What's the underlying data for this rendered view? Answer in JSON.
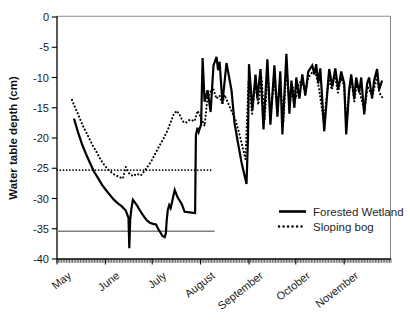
{
  "frame": {
    "background": "#ffffff",
    "plot_border_color": "#8c8c8c",
    "axis_color": "#000000",
    "text_color": "#1a1a1a",
    "tick_label_font_px": 11,
    "legend_font_px": 11.5
  },
  "chart_data": {
    "type": "line",
    "title": "",
    "ylabel": "Water table depth (cm)",
    "xlabel": "",
    "y_axis": {
      "label": "Water table depth (cm)",
      "min": -40,
      "max": 0,
      "tick_step": 5,
      "ticks": [
        0,
        -5,
        -10,
        -15,
        -20,
        -25,
        -30,
        -35,
        -40
      ]
    },
    "x_axis": {
      "unit": "days since May 1",
      "total_days": 214,
      "minor_ticks": "daily",
      "months": [
        {
          "label": "May",
          "start_day": 0
        },
        {
          "label": "June",
          "start_day": 31
        },
        {
          "label": "July",
          "start_day": 61
        },
        {
          "label": "August",
          "start_day": 92
        },
        {
          "label": "September",
          "start_day": 123
        },
        {
          "label": "October",
          "start_day": 153
        },
        {
          "label": "November",
          "start_day": 184
        }
      ]
    },
    "legend": {
      "position": "inside-lower-right",
      "entries": [
        "Forested Wetland",
        "Sloping bog"
      ]
    },
    "reference_lines": [
      {
        "for": "Forested Wetland",
        "style": "solid",
        "color": "#7f7f7f",
        "value": -35.4,
        "from_day": 0,
        "to_day": 101
      },
      {
        "for": "Sloping bog",
        "style": "dotted",
        "color": "#000000",
        "value": -25.3,
        "from_day": 0,
        "to_day": 99
      }
    ],
    "series": [
      {
        "name": "Forested Wetland",
        "style": "solid",
        "color": "#000000",
        "points": [
          [
            10.9,
            -16.8
          ],
          [
            13.4,
            -19.0
          ],
          [
            16.0,
            -21.0
          ],
          [
            18.5,
            -22.6
          ],
          [
            21.1,
            -24.1
          ],
          [
            23.6,
            -25.5
          ],
          [
            26.2,
            -26.6
          ],
          [
            28.8,
            -27.7
          ],
          [
            31.3,
            -28.6
          ],
          [
            33.9,
            -29.4
          ],
          [
            36.4,
            -30.2
          ],
          [
            39.0,
            -30.8
          ],
          [
            41.5,
            -31.3
          ],
          [
            44.1,
            -32.0
          ],
          [
            45.8,
            -33.2
          ],
          [
            46.3,
            -38.2
          ],
          [
            46.9,
            -33.5
          ],
          [
            47.6,
            -31.8
          ],
          [
            48.6,
            -30.2
          ],
          [
            51.1,
            -31.1
          ],
          [
            53.0,
            -31.9
          ],
          [
            55.0,
            -32.7
          ],
          [
            57.5,
            -33.6
          ],
          [
            59.5,
            -34.0
          ],
          [
            61.5,
            -34.2
          ],
          [
            63.5,
            -34.3
          ],
          [
            64.5,
            -34.9
          ],
          [
            66.0,
            -35.5
          ],
          [
            67.5,
            -36.2
          ],
          [
            69.0,
            -36.4
          ],
          [
            69.8,
            -35.7
          ],
          [
            70.3,
            -33.6
          ],
          [
            71.0,
            -31.9
          ],
          [
            71.9,
            -31.1
          ],
          [
            72.8,
            -31.6
          ],
          [
            73.6,
            -30.7
          ],
          [
            75.4,
            -28.6
          ],
          [
            77.3,
            -29.8
          ],
          [
            79.9,
            -30.9
          ],
          [
            81.8,
            -32.2
          ],
          [
            85.0,
            -32.3
          ],
          [
            88.5,
            -32.4
          ],
          [
            89.0,
            -19.5
          ],
          [
            90.0,
            -18.3
          ],
          [
            90.8,
            -19.0
          ],
          [
            91.5,
            -18.4
          ],
          [
            92.3,
            -17.8
          ],
          [
            93.3,
            -6.8
          ],
          [
            94.6,
            -14.0
          ],
          [
            96.5,
            -12.1
          ],
          [
            98.4,
            -15.7
          ],
          [
            100.3,
            -8.0
          ],
          [
            102.2,
            -6.6
          ],
          [
            103.2,
            -8.8
          ],
          [
            104.2,
            -7.4
          ],
          [
            106.0,
            -14.2
          ],
          [
            108.6,
            -7.6
          ],
          [
            111.8,
            -12.1
          ],
          [
            113.7,
            -17.5
          ],
          [
            115.6,
            -20.3
          ],
          [
            118.2,
            -24.0
          ],
          [
            121.4,
            -27.6
          ],
          [
            122.4,
            -20.0
          ],
          [
            123.0,
            -7.8
          ],
          [
            125.2,
            -15.3
          ],
          [
            127.2,
            -9.5
          ],
          [
            128.4,
            -13.5
          ],
          [
            130.4,
            -8.6
          ],
          [
            132.3,
            -18.6
          ],
          [
            134.8,
            -7.0
          ],
          [
            136.7,
            -17.8
          ],
          [
            139.3,
            -8.0
          ],
          [
            141.2,
            -16.5
          ],
          [
            143.1,
            -9.0
          ],
          [
            144.4,
            -19.4
          ],
          [
            147.0,
            -6.1
          ],
          [
            148.9,
            -16.0
          ],
          [
            150.2,
            -10.5
          ],
          [
            152.1,
            -15.0
          ],
          [
            153.3,
            -10.0
          ],
          [
            155.3,
            -13.5
          ],
          [
            157.2,
            -9.5
          ],
          [
            159.1,
            -13.0
          ],
          [
            161.0,
            -9.0
          ],
          [
            163.6,
            -8.0
          ],
          [
            164.9,
            -9.5
          ],
          [
            166.1,
            -7.8
          ],
          [
            167.4,
            -11.0
          ],
          [
            168.7,
            -8.5
          ],
          [
            171.2,
            -18.9
          ],
          [
            174.4,
            -8.6
          ],
          [
            176.4,
            -11.5
          ],
          [
            178.3,
            -8.5
          ],
          [
            180.2,
            -12.0
          ],
          [
            182.1,
            -9.0
          ],
          [
            184.0,
            -11.0
          ],
          [
            185.3,
            -19.4
          ],
          [
            187.2,
            -12.0
          ],
          [
            188.5,
            -9.5
          ],
          [
            190.4,
            -13.5
          ],
          [
            191.7,
            -10.0
          ],
          [
            193.6,
            -12.5
          ],
          [
            194.9,
            -10.0
          ],
          [
            196.8,
            -16.1
          ],
          [
            198.7,
            -11.0
          ],
          [
            200.0,
            -10.0
          ],
          [
            201.9,
            -13.5
          ],
          [
            203.2,
            -10.5
          ],
          [
            205.1,
            -8.6
          ],
          [
            206.4,
            -12.0
          ],
          [
            208.3,
            -10.5
          ]
        ]
      },
      {
        "name": "Sloping bog",
        "style": "dotted",
        "color": "#000000",
        "points": [
          [
            9.6,
            -13.7
          ],
          [
            11.5,
            -14.9
          ],
          [
            13.4,
            -16.0
          ],
          [
            15.3,
            -17.2
          ],
          [
            17.2,
            -18.3
          ],
          [
            19.2,
            -19.3
          ],
          [
            21.1,
            -20.3
          ],
          [
            23.0,
            -21.3
          ],
          [
            24.9,
            -22.1
          ],
          [
            26.8,
            -23.0
          ],
          [
            28.8,
            -23.9
          ],
          [
            30.7,
            -24.6
          ],
          [
            33.9,
            -25.5
          ],
          [
            37.1,
            -26.1
          ],
          [
            40.3,
            -26.5
          ],
          [
            42.2,
            -26.7
          ],
          [
            44.1,
            -24.8
          ],
          [
            46.0,
            -25.8
          ],
          [
            48.6,
            -26.3
          ],
          [
            51.1,
            -25.9
          ],
          [
            53.7,
            -26.2
          ],
          [
            56.2,
            -25.4
          ],
          [
            58.1,
            -24.7
          ],
          [
            60.7,
            -23.7
          ],
          [
            63.3,
            -22.4
          ],
          [
            65.8,
            -21.2
          ],
          [
            68.4,
            -20.0
          ],
          [
            70.9,
            -18.7
          ],
          [
            72.8,
            -17.4
          ],
          [
            74.8,
            -16.1
          ],
          [
            76.7,
            -15.5
          ],
          [
            78.6,
            -16.2
          ],
          [
            80.5,
            -17.2
          ],
          [
            82.4,
            -17.5
          ],
          [
            85.0,
            -17.0
          ],
          [
            88.2,
            -17.2
          ],
          [
            90.1,
            -15.5
          ],
          [
            92.0,
            -16.5
          ],
          [
            94.6,
            -18.0
          ],
          [
            96.5,
            -13.2
          ],
          [
            98.4,
            -12.3
          ],
          [
            100.3,
            -12.0
          ],
          [
            102.2,
            -13.5
          ],
          [
            104.2,
            -13.0
          ],
          [
            106.0,
            -14.5
          ],
          [
            107.3,
            -12.9
          ],
          [
            109.2,
            -14.0
          ],
          [
            111.8,
            -15.5
          ],
          [
            114.4,
            -17.0
          ],
          [
            117.0,
            -19.5
          ],
          [
            118.9,
            -21.5
          ],
          [
            120.8,
            -23.5
          ],
          [
            122.7,
            -10.6
          ],
          [
            125.0,
            -16.0
          ],
          [
            127.0,
            -11.0
          ],
          [
            129.0,
            -14.5
          ],
          [
            131.0,
            -10.0
          ],
          [
            133.0,
            -17.0
          ],
          [
            135.0,
            -9.5
          ],
          [
            137.0,
            -16.0
          ],
          [
            139.0,
            -10.0
          ],
          [
            141.0,
            -15.0
          ],
          [
            143.0,
            -10.5
          ],
          [
            145.0,
            -17.5
          ],
          [
            147.0,
            -8.5
          ],
          [
            149.0,
            -14.5
          ],
          [
            151.0,
            -11.5
          ],
          [
            153.0,
            -13.5
          ],
          [
            155.0,
            -11.0
          ],
          [
            157.0,
            -10.5
          ],
          [
            159.0,
            -12.5
          ],
          [
            161.0,
            -10.0
          ],
          [
            164.0,
            -9.0
          ],
          [
            166.0,
            -9.5
          ],
          [
            168.0,
            -12.0
          ],
          [
            171.0,
            -17.5
          ],
          [
            174.0,
            -10.0
          ],
          [
            176.0,
            -12.0
          ],
          [
            178.0,
            -9.5
          ],
          [
            180.0,
            -12.5
          ],
          [
            182.0,
            -10.0
          ],
          [
            184.0,
            -11.5
          ],
          [
            185.5,
            -17.5
          ],
          [
            187.0,
            -12.5
          ],
          [
            189.0,
            -10.5
          ],
          [
            190.5,
            -14.0
          ],
          [
            192.0,
            -11.0
          ],
          [
            194.0,
            -12.5
          ],
          [
            197.0,
            -15.5
          ],
          [
            199.0,
            -11.5
          ],
          [
            202.0,
            -13.0
          ],
          [
            204.0,
            -11.0
          ],
          [
            205.0,
            -9.5
          ],
          [
            206.5,
            -12.5
          ],
          [
            209.0,
            -13.5
          ]
        ]
      }
    ]
  }
}
